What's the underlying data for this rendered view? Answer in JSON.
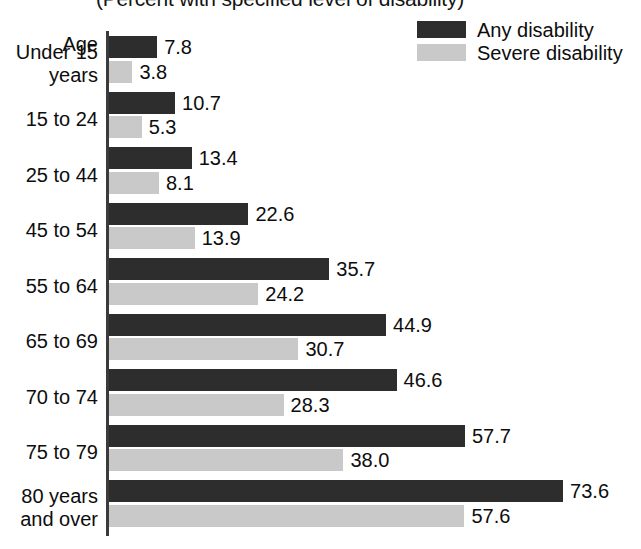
{
  "chart_data": {
    "type": "bar",
    "orientation": "horizontal",
    "title": "(Percent with specified level of disability)",
    "xlabel": "",
    "ylabel": "Age",
    "grid": false,
    "legend_position": "top-right",
    "xlim": [
      0,
      80
    ],
    "axis_origin_value": 0,
    "categories": [
      "Under 15\nyears",
      "15 to 24",
      "25 to 44",
      "45 to 54",
      "55 to 64",
      "65 to 69",
      "70 to 74",
      "75 to 79",
      "80 years\nand over"
    ],
    "series": [
      {
        "name": "Any disability",
        "color": "#2d2d2d",
        "values": [
          7.8,
          10.7,
          13.4,
          22.6,
          35.7,
          44.9,
          46.6,
          57.7,
          73.6
        ]
      },
      {
        "name": "Severe disability",
        "color": "#c9c9c9",
        "values": [
          3.8,
          5.3,
          8.1,
          13.9,
          24.2,
          30.7,
          28.3,
          38.0,
          57.6
        ]
      }
    ],
    "value_labels": {
      "Any disability": [
        "7.8",
        "10.7",
        "13.4",
        "22.6",
        "35.7",
        "44.9",
        "46.6",
        "57.7",
        "73.6"
      ],
      "Severe disability": [
        "3.8",
        "5.3",
        "8.1",
        "13.9",
        "24.2",
        "30.7",
        "28.3",
        "38.0",
        "57.6"
      ]
    }
  },
  "legend": {
    "items": [
      {
        "label": "Any disability",
        "color": "#2d2d2d"
      },
      {
        "label": "Severe disability",
        "color": "#c9c9c9"
      }
    ]
  },
  "axis": {
    "category_header": "Age"
  },
  "colors": {
    "any_disability": "#2d2d2d",
    "severe_disability": "#c9c9c9",
    "axis": "#3b3b3b",
    "text": "#0d0d0d",
    "background": "#ffffff"
  }
}
